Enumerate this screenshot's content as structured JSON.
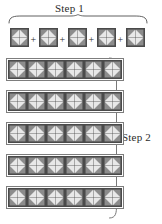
{
  "figure": {
    "title_step1": "Step 1",
    "title_step2": "Step 2",
    "operator": "+",
    "background_color": "#ffffff",
    "ink_color": "#2b2b2b",
    "tile": {
      "name": "pinwheel-block",
      "size_px": 19,
      "colors": {
        "dark": "#8c8c8c",
        "light": "#e8e8e8",
        "outline": "#4a4a4a",
        "mid": "#b5b5b5"
      },
      "quadrants": 4,
      "triangles_per_quadrant": 2
    },
    "step1": {
      "label": "Step 1",
      "tile_count": 5,
      "operators": [
        "+",
        "+",
        "+",
        "+"
      ],
      "brace": "horizontal-top-brace",
      "tiles_x": [
        10,
        39,
        68,
        97,
        126
      ],
      "tiles_y": 28
    },
    "step2": {
      "label": "Step 2",
      "rows": 5,
      "columns": 6,
      "total_tiles": 30,
      "brace": "vertical-right-brace",
      "row_y": [
        60,
        92,
        124,
        156,
        188
      ],
      "row_x": 8,
      "tile_size": 19
    }
  }
}
